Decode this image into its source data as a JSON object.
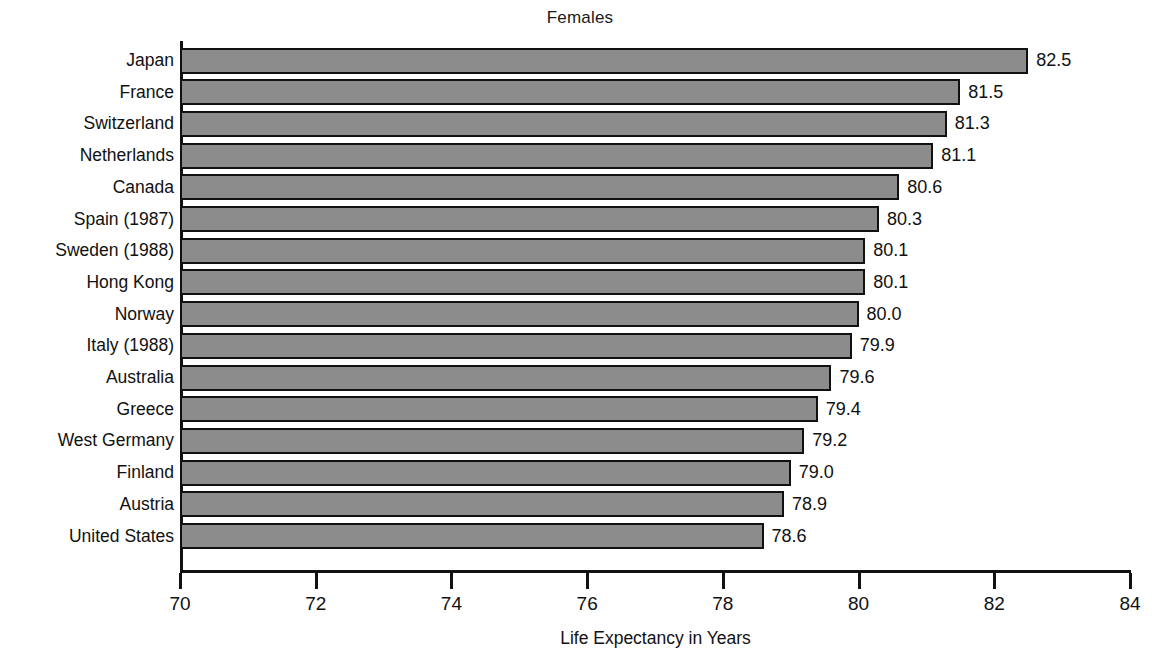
{
  "chart_data": {
    "type": "bar",
    "orientation": "horizontal",
    "title": "Females",
    "xlabel": "Life Expectancy in Years",
    "ylabel": "",
    "xlim": [
      70,
      84
    ],
    "xticks": [
      70,
      72,
      74,
      76,
      78,
      80,
      82,
      84
    ],
    "xticklabels": [
      "70",
      "72",
      "74",
      "76",
      "78",
      "80",
      "82",
      "84"
    ],
    "grid": false,
    "legend": false,
    "bar_fill_color": "#8c8c8c",
    "bar_edge_color": "#111111",
    "background_color": "#ffffff",
    "categories": [
      "Japan",
      "France",
      "Switzerland",
      "Netherlands",
      "Canada",
      "Spain (1987)",
      "Sweden (1988)",
      "Hong Kong",
      "Norway",
      "Italy (1988)",
      "Australia",
      "Greece",
      "West Germany",
      "Finland",
      "Austria",
      "United States"
    ],
    "values": [
      82.5,
      81.5,
      81.3,
      81.1,
      80.6,
      80.3,
      80.1,
      80.1,
      80.0,
      79.9,
      79.6,
      79.4,
      79.2,
      79.0,
      78.9,
      78.6
    ],
    "value_labels": [
      "82.5",
      "81.5",
      "81.3",
      "81.1",
      "80.6",
      "80.3",
      "80.1",
      "80.1",
      "80.0",
      "79.9",
      "79.6",
      "79.4",
      "79.2",
      "79.0",
      "78.9",
      "78.6"
    ]
  }
}
